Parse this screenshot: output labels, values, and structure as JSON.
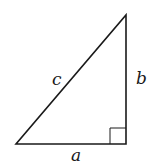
{
  "diagram": {
    "type": "right-triangle",
    "labels": {
      "hypotenuse": "c",
      "vertical_leg": "b",
      "horizontal_leg": "a"
    },
    "right_angle_marker": true,
    "colors": {
      "stroke": "#1a1a1a",
      "background": "#ffffff"
    }
  }
}
